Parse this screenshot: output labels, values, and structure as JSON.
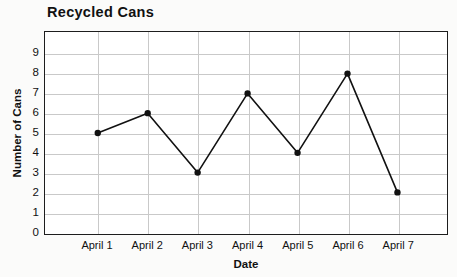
{
  "chart_data": {
    "type": "line",
    "title": "Recycled Cans",
    "xlabel": "Date",
    "ylabel": "Number of Cans",
    "categories": [
      "April 1",
      "April 2",
      "April 3",
      "April 4",
      "April 5",
      "April 6",
      "April 7"
    ],
    "values": [
      5,
      6,
      3,
      7,
      4,
      8,
      2
    ],
    "yticks": [
      9,
      8,
      7,
      6,
      5,
      4,
      3,
      2,
      1,
      0
    ],
    "ylim": [
      0,
      9.8
    ],
    "grid": "both",
    "legend": "none",
    "series_color": "#111111",
    "grid_color": "#c9c9c9",
    "frame_color": "#1d1d1d",
    "marker": "filled-circle"
  }
}
